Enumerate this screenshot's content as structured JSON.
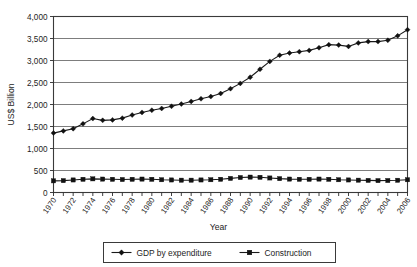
{
  "chart_data": {
    "type": "line",
    "title": "",
    "xlabel": "Year",
    "ylabel": "US$ Billion",
    "ylim": [
      0,
      4000
    ],
    "ytick_labels": [
      "4,000",
      "3,500",
      "3,000",
      "2,500",
      "2,000",
      "1,500",
      "1,000",
      "500",
      "0"
    ],
    "ytick_values": [
      4000,
      3500,
      3000,
      2500,
      2000,
      1500,
      1000,
      500,
      0
    ],
    "grid": true,
    "legend_position": "bottom-center",
    "x": [
      1970,
      1971,
      1972,
      1973,
      1974,
      1975,
      1976,
      1977,
      1978,
      1979,
      1980,
      1981,
      1982,
      1983,
      1984,
      1985,
      1986,
      1987,
      1988,
      1989,
      1990,
      1991,
      1992,
      1993,
      1994,
      1995,
      1996,
      1997,
      1998,
      1999,
      2000,
      2001,
      2002,
      2003,
      2004,
      2005,
      2006
    ],
    "xtick_labels": [
      "1970",
      "1972",
      "1974",
      "1976",
      "1978",
      "1980",
      "1982",
      "1984",
      "1986",
      "1988",
      "1990",
      "1992",
      "1994",
      "1996",
      "1998",
      "2000",
      "2002",
      "2004",
      "2006"
    ],
    "series": [
      {
        "name": "GDP by expenditure",
        "marker": "diamond",
        "values": [
          1350,
          1400,
          1450,
          1560,
          1680,
          1640,
          1650,
          1690,
          1760,
          1820,
          1870,
          1910,
          1960,
          2010,
          2070,
          2130,
          2180,
          2250,
          2360,
          2480,
          2620,
          2800,
          2980,
          3120,
          3170,
          3200,
          3230,
          3290,
          3360,
          3350,
          3320,
          3400,
          3430,
          3430,
          3460,
          3560,
          3700
        ]
      },
      {
        "name": "Construction",
        "marker": "square",
        "values": [
          265,
          270,
          285,
          300,
          310,
          305,
          300,
          295,
          300,
          305,
          300,
          290,
          285,
          280,
          280,
          285,
          290,
          300,
          320,
          340,
          350,
          345,
          330,
          315,
          305,
          300,
          300,
          305,
          300,
          290,
          285,
          280,
          275,
          270,
          272,
          278,
          290
        ]
      }
    ]
  },
  "legend": {
    "items": [
      {
        "label": "GDP by expenditure",
        "marker": "diamond-marker"
      },
      {
        "label": "Construction",
        "marker": "square-marker"
      }
    ]
  }
}
